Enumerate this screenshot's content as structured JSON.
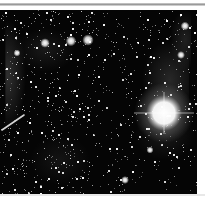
{
  "image": {
    "description": "Two side-by-side grayscale astronomical star-field panels; the right panel contains a very bright saturated star",
    "background_color": "#050505",
    "page_background": "#ffffff",
    "figure_box": {
      "x": 0,
      "y": 10,
      "width": 197,
      "height": 184
    }
  },
  "panels": [
    {
      "name": "left",
      "x": 0,
      "width": 95,
      "seed": 17,
      "star_count": 520,
      "nebula": [
        {
          "cx": 8,
          "cy": 65,
          "rx": 18,
          "ry": 55,
          "alpha": 0.22
        },
        {
          "cx": 45,
          "cy": 40,
          "rx": 30,
          "ry": 22,
          "alpha": 0.1
        },
        {
          "cx": 60,
          "cy": 150,
          "rx": 30,
          "ry": 25,
          "alpha": 0.08
        }
      ],
      "bright_stars": [
        {
          "x": 45,
          "y": 33,
          "r": 2.2
        },
        {
          "x": 71,
          "y": 31,
          "r": 2.4
        },
        {
          "x": 88,
          "y": 30,
          "r": 2.6
        },
        {
          "x": 17,
          "y": 43,
          "r": 1.6
        }
      ],
      "streak": {
        "x1": 2,
        "y1": 120,
        "x2": 24,
        "y2": 105,
        "width": 1.6
      }
    },
    {
      "name": "right",
      "x": 95,
      "width": 102,
      "seed": 53,
      "star_count": 380,
      "nebula": [
        {
          "cx": 75,
          "cy": 70,
          "rx": 28,
          "ry": 40,
          "alpha": 0.18
        },
        {
          "cx": 90,
          "cy": 30,
          "rx": 15,
          "ry": 30,
          "alpha": 0.14
        },
        {
          "cx": 70,
          "cy": 125,
          "rx": 30,
          "ry": 25,
          "alpha": 0.1
        }
      ],
      "bright_stars": [
        {
          "x": 90,
          "y": 16,
          "r": 2.0
        },
        {
          "x": 86,
          "y": 45,
          "r": 1.8
        },
        {
          "x": 30,
          "y": 170,
          "r": 1.8
        },
        {
          "x": 55,
          "y": 140,
          "r": 1.6
        }
      ],
      "dominant_star": {
        "x": 69,
        "y": 103,
        "core_radius": 11,
        "halo_radius": 30
      }
    }
  ]
}
